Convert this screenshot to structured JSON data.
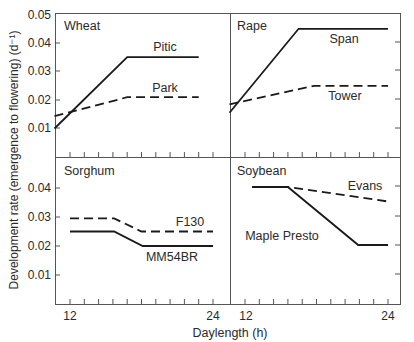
{
  "chart_data": {
    "type": "line",
    "title": "",
    "xlabel": "Daylength (h)",
    "ylabel": "Development rate (emergence to flowering) (d⁻¹)",
    "yticks": [
      "0.01",
      "0.02",
      "0.03",
      "0.04",
      "0.05"
    ],
    "xticks_labeled": [
      "12",
      "24"
    ],
    "ylim": [
      0,
      0.05
    ],
    "xlim": [
      10.7,
      25.5
    ],
    "grid": false,
    "layout": "2x2 panels sharing axes",
    "panels": [
      {
        "name": "Wheat",
        "series": [
          {
            "name": "Pitic",
            "style": "solid",
            "x": [
              10.7,
              16.8,
              22.8
            ],
            "y": [
              0.01,
              0.035,
              0.035
            ]
          },
          {
            "name": "Park",
            "style": "dashed",
            "x": [
              10.7,
              16.8,
              22.8
            ],
            "y": [
              0.0143,
              0.021,
              0.021
            ]
          }
        ]
      },
      {
        "name": "Rape",
        "series": [
          {
            "name": "Span",
            "style": "solid",
            "x": [
              10.7,
              16.5,
              24.0
            ],
            "y": [
              0.0155,
              0.045,
              0.045
            ]
          },
          {
            "name": "Tower",
            "style": "dashed",
            "x": [
              10.7,
              17.8,
              24.0
            ],
            "y": [
              0.0185,
              0.025,
              0.025
            ]
          }
        ]
      },
      {
        "name": "Sorghum",
        "series": [
          {
            "name": "F130",
            "style": "dashed",
            "x": [
              12.0,
              15.7,
              18.0,
              24.0
            ],
            "y": [
              0.0295,
              0.0295,
              0.025,
              0.025
            ]
          },
          {
            "name": "MM54BR",
            "style": "solid",
            "x": [
              12.0,
              15.7,
              18.1,
              24.0
            ],
            "y": [
              0.025,
              0.025,
              0.02,
              0.02
            ]
          }
        ]
      },
      {
        "name": "Soybean",
        "series": [
          {
            "name": "Maple Presto",
            "style": "solid",
            "x": [
              12.6,
              15.6,
              21.5,
              24.0
            ],
            "y": [
              0.04,
              0.04,
              0.02,
              0.02
            ]
          },
          {
            "name": "Evans",
            "style": "dashed",
            "x": [
              12.6,
              15.6,
              24.0
            ],
            "y": [
              0.04,
              0.04,
              0.035
            ]
          }
        ]
      }
    ]
  },
  "labels": {
    "panel_titles": [
      "Wheat",
      "Rape",
      "Sorghum",
      "Soybean"
    ],
    "series_labels": {
      "pitic": "Pitic",
      "park": "Park",
      "span": "Span",
      "tower": "Tower",
      "f130": "F130",
      "mm54br": "MM54BR",
      "maple_presto": "Maple Presto",
      "evans": "Evans"
    },
    "ytick_top": [
      "0.05",
      "0.04",
      "0.03",
      "0.02",
      "0.01"
    ],
    "ytick_bottom": [
      "0.04",
      "0.03",
      "0.02",
      "0.01"
    ],
    "xtick_left": {
      "start": "12",
      "end": "24"
    },
    "xtick_right": {
      "start": "12",
      "end": "24"
    },
    "xlabel": "Daylength (h)",
    "ylabel": "Development rate (emergence to flowering) (d⁻¹)"
  }
}
